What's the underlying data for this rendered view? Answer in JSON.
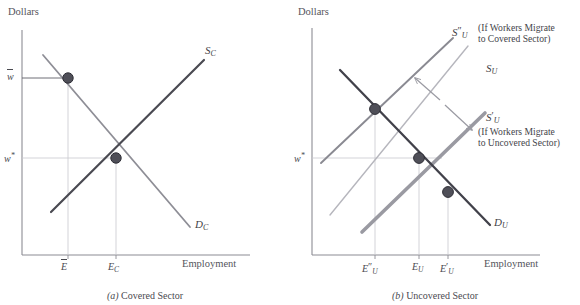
{
  "figure": {
    "top_partial_line": "​",
    "panels": [
      {
        "id": "covered",
        "caption_prefix": "(a)",
        "caption": "Covered Sector",
        "y_axis_title": "Dollars",
        "x_axis_title": "Employment",
        "y_ticks": [
          {
            "label": "w",
            "modifier": "bar",
            "value": 0.78
          },
          {
            "label": "w",
            "modifier": "star",
            "value": 0.46
          }
        ],
        "x_ticks": [
          {
            "label": "E",
            "modifier": "bar",
            "value": 0.255
          },
          {
            "label": "E",
            "subscript": "C",
            "value": 0.465
          }
        ],
        "curves": [
          {
            "name": "S_C",
            "label": "S",
            "subscript": "C",
            "color": "#4a4a52",
            "width": 2.2,
            "kind": "supply"
          },
          {
            "name": "D_C",
            "label": "D",
            "subscript": "C",
            "color": "#8e8e96",
            "width": 1.8,
            "kind": "demand"
          }
        ],
        "points": [
          {
            "name": "constrained-employment-point",
            "x": 0.255,
            "y": 0.78
          },
          {
            "name": "equilibrium-point",
            "x": 0.465,
            "y": 0.46
          }
        ]
      },
      {
        "id": "uncovered",
        "caption_prefix": "(b)",
        "caption": "Uncovered Sector",
        "y_axis_title": "Dollars",
        "x_axis_title": "Employment",
        "y_ticks": [
          {
            "label": "w",
            "modifier": "star",
            "value": 0.46
          }
        ],
        "x_ticks": [
          {
            "label": "E",
            "modifier": "dprime",
            "subscript": "U",
            "value": 0.295
          },
          {
            "label": "E",
            "subscript": "U",
            "value": 0.445
          },
          {
            "label": "E",
            "modifier": "prime",
            "subscript": "U",
            "value": 0.545
          }
        ],
        "curves": [
          {
            "name": "S_U_dprime",
            "label": "S",
            "modifier": "dprime",
            "subscript": "U",
            "color": "#8a8a92",
            "width": 1.9,
            "kind": "supply-shift-left"
          },
          {
            "name": "S_U",
            "label": "S",
            "subscript": "U",
            "color": "#b6b6bd",
            "width": 1.4,
            "kind": "supply"
          },
          {
            "name": "S_U_prime",
            "label": "S",
            "modifier": "prime",
            "subscript": "U",
            "color": "#9a9aa2",
            "width": 3.6,
            "kind": "supply-shift-right"
          },
          {
            "name": "D_U",
            "label": "D",
            "subscript": "U",
            "color": "#41414a",
            "width": 2.3,
            "kind": "demand"
          }
        ],
        "points": [
          {
            "name": "high-wage-point",
            "x": 0.295,
            "y": 0.625
          },
          {
            "name": "initial-equilibrium-point",
            "x": 0.445,
            "y": 0.46
          },
          {
            "name": "low-wage-point",
            "x": 0.545,
            "y": 0.345
          }
        ],
        "annotations": [
          {
            "name": "migrate-to-covered-note",
            "curve_label": "S",
            "curve_modifier": "dprime",
            "curve_subscript": "U",
            "line1": "(If Workers Migrate",
            "line2": "to Covered Sector)"
          },
          {
            "name": "migrate-to-uncovered-note",
            "curve_label": "S",
            "curve_modifier": "prime",
            "curve_subscript": "U",
            "line1": "(If Workers Migrate",
            "line2": "to Uncovered Sector)"
          }
        ],
        "arrows": [
          {
            "name": "shift-left-arrow",
            "direction": "up-left"
          },
          {
            "name": "shift-right-arrow",
            "direction": "down-right"
          }
        ]
      }
    ]
  },
  "colors": {
    "axis": "#8c8c94",
    "guide": "#c8c8ce",
    "point_fill": "#4f4f58",
    "point_stroke": "#2e2e36",
    "text": "#44444a"
  }
}
